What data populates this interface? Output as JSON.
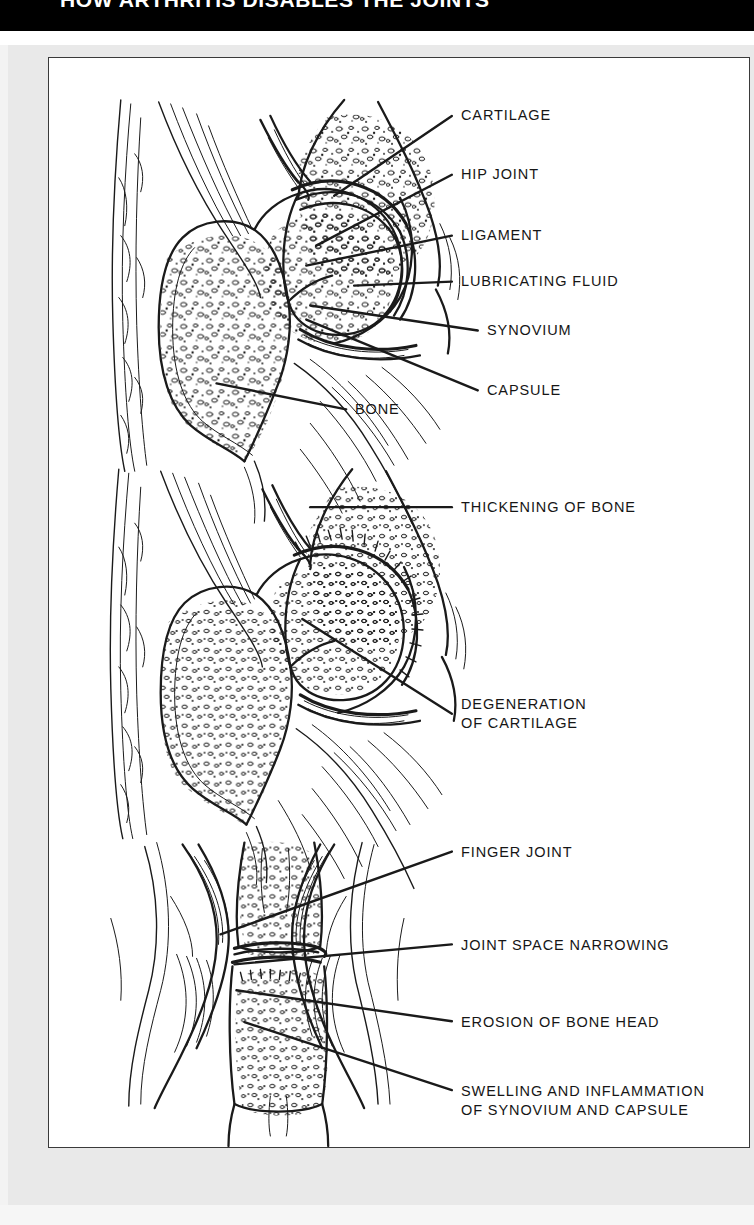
{
  "banner": {
    "title": "HOW ARTHRITIS DISABLES THE JOINTS",
    "background": "#000000",
    "text_color": "#ffffff"
  },
  "colors": {
    "page_background": "#ffffff",
    "mat": "#e9e9e9",
    "panel_background": "#ffffff",
    "panel_border": "#3a3a3a",
    "ink": "#161616"
  },
  "figure": {
    "caption_font_style": "uppercase geometric sans",
    "panels": [
      {
        "id": "panel-normal-hip",
        "name": "normal-hip-joint-cross-section",
        "labels": [
          {
            "id": "cartilage",
            "text": "CARTILAGE"
          },
          {
            "id": "hip-joint",
            "text": "HIP JOINT"
          },
          {
            "id": "ligament",
            "text": "LIGAMENT"
          },
          {
            "id": "lubricating-fluid",
            "text": "LUBRICATING FLUID"
          },
          {
            "id": "synovium",
            "text": "SYNOVIUM"
          },
          {
            "id": "capsule",
            "text": "CAPSULE"
          },
          {
            "id": "bone",
            "text": "BONE"
          }
        ]
      },
      {
        "id": "panel-osteoarthritic-hip",
        "name": "osteoarthritic-hip-joint-cross-section",
        "labels": [
          {
            "id": "thickening-of-bone",
            "text": "THICKENING OF BONE"
          },
          {
            "id": "degeneration-cartilage",
            "text": "DEGENERATION\nOF CARTILAGE"
          }
        ]
      },
      {
        "id": "panel-finger-joint",
        "name": "rheumatoid-finger-joint-cross-section",
        "labels": [
          {
            "id": "finger-joint",
            "text": "FINGER JOINT"
          },
          {
            "id": "joint-space-narrowing",
            "text": "JOINT SPACE NARROWING"
          },
          {
            "id": "erosion-of-bone-head",
            "text": "EROSION OF BONE HEAD"
          },
          {
            "id": "swelling-inflammation",
            "text": "SWELLING AND INFLAMMATION\nOF SYNOVIUM AND CAPSULE"
          }
        ]
      }
    ]
  }
}
